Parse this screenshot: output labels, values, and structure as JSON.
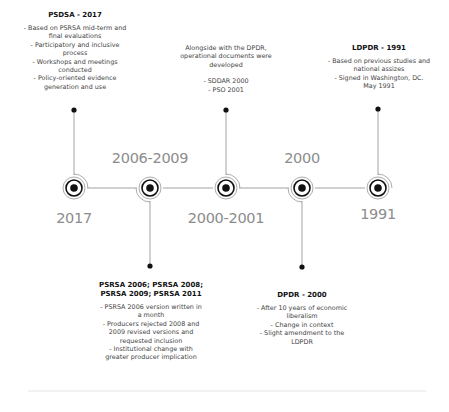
{
  "timeline": {
    "nodes": [
      {
        "year": "2017",
        "x": 74,
        "label_pos": "below"
      },
      {
        "year": "2006-2009",
        "x": 150,
        "label_pos": "above"
      },
      {
        "year": "2000-2001",
        "x": 226,
        "label_pos": "below"
      },
      {
        "year": "2000",
        "x": 302,
        "label_pos": "above"
      },
      {
        "year": "1991",
        "x": 378,
        "label_pos": "below"
      }
    ],
    "colors": {
      "line": "#999999",
      "node": "#111111",
      "year_text": "#8c8c8c"
    }
  },
  "blocks": {
    "psdsa": {
      "title": "PSDSA - 2017",
      "lines": [
        "- Based on PSRSA mid-term and",
        "final evaluations",
        "- Participatory and inclusive",
        "process",
        "- Workshops and meetings",
        "conducted",
        "- Policy-oriented evidence",
        "generation and use"
      ]
    },
    "operational": {
      "title": "",
      "lines": [
        "Alongside with the DPDR,",
        "operational documents were",
        "developed",
        "",
        "- SDDAR 2000",
        "- PSO 2001"
      ]
    },
    "ldpdr": {
      "title": "LDPDR - 1991",
      "lines": [
        "- Based on previous studies and",
        "national assizes",
        "- Signed in Washington, DC.",
        "May 1991"
      ]
    },
    "psrsa": {
      "title_lines": [
        "PSRSA 2006; PSRSA 2008;",
        "PSRSA 2009; PSRSA 2011"
      ],
      "lines": [
        "- PSRSA 2006 version written in",
        "a month",
        "- Producers rejected 2008 and",
        "2009 revised versions and",
        "requested inclusion",
        "- Institutional change with",
        "greater producer implication"
      ]
    },
    "dpdr": {
      "title": "DPDR - 2000",
      "lines": [
        "- After 10 years of economic",
        "liberalism",
        "- Change in context",
        "- Slight amendment to the",
        "LDPDR"
      ]
    }
  }
}
